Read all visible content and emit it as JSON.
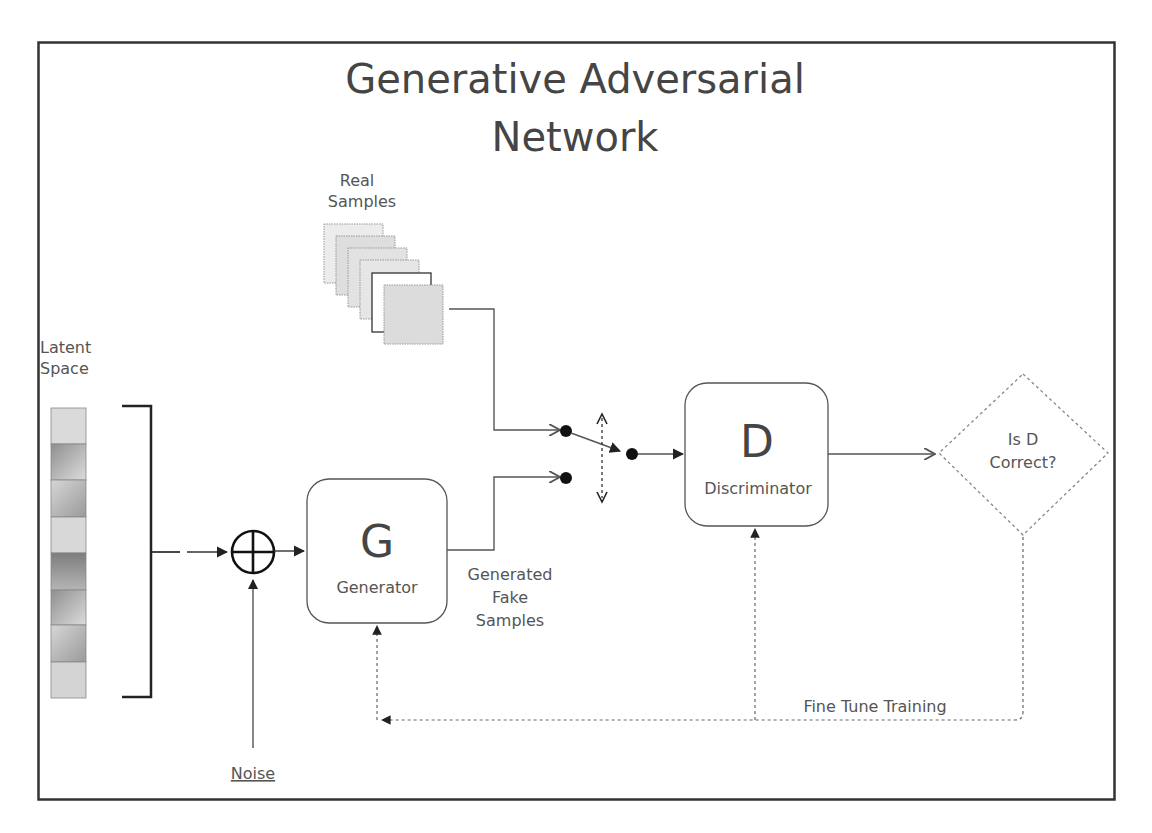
{
  "diagram": {
    "title_line1": "Generative Adversarial",
    "title_line2": "Network",
    "real_samples": {
      "line1": "Real",
      "line2": "Samples",
      "count": 6
    },
    "latent_space": {
      "line1": "Latent",
      "line2": "Space",
      "cells": 8
    },
    "noise": {
      "label": "Noise"
    },
    "sum_node": {
      "icon": "circle-plus-icon"
    },
    "generator": {
      "letter": "G",
      "label": "Generator"
    },
    "generated_samples": {
      "line1": "Generated",
      "line2": "Fake",
      "line3": "Samples"
    },
    "discriminator": {
      "letter": "D",
      "label": "Discriminator"
    },
    "decision": {
      "line1": "Is D",
      "line2": "Correct?"
    },
    "feedback": {
      "label": "Fine Tune Training"
    }
  },
  "colors": {
    "frame": "#333333",
    "line": "#555555",
    "text": "#4a4a4a",
    "sample_fill": "#e0e0e0",
    "dashed": "#777777"
  }
}
